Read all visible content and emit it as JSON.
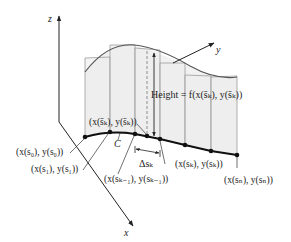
{
  "diagram": {
    "type": "3d-line-integral-illustration",
    "axes": {
      "x_label": "x",
      "y_label": "y",
      "z_label": "z"
    },
    "curve_label": "C",
    "height_label": "Height = f(x(s̄ₖ), y(s̄ₖ))",
    "delta_label": "Δsₖ",
    "point_labels": {
      "s0": "(x(s₀), y(s₀))",
      "s1": "(x(s₁), y(s₁))",
      "sbar_k": "(x(s̄ₖ), y(s̄ₖ))",
      "s_k_minus_1": "(x(sₖ₋₁), y(sₖ₋₁))",
      "s_k": "(x(sₖ), y(sₖ))",
      "s_n": "(x(sₙ), y(sₙ))"
    },
    "colors": {
      "panel_fill": "#efefef",
      "panel_edge": "#9a9a9a",
      "curve": "#111111",
      "axis": "#222222"
    }
  }
}
